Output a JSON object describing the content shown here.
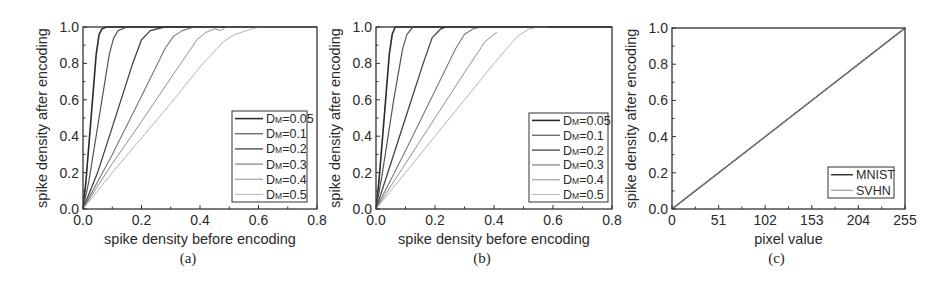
{
  "figure": {
    "panels": [
      "a",
      "b",
      "c"
    ]
  },
  "chart_data": [
    {
      "id": "a",
      "type": "line",
      "caption": "(a)",
      "xlabel": "spike density before encoding",
      "ylabel": "spike density after encoding",
      "xlim": [
        0,
        0.8
      ],
      "ylim": [
        0,
        1.0
      ],
      "xticks": [
        "0.0",
        "0.2",
        "0.4",
        "0.6",
        "0.8"
      ],
      "yticks": [
        "0.0",
        "0.2",
        "0.4",
        "0.6",
        "0.8",
        "1.0"
      ],
      "grid": false,
      "legend_position": "lower right",
      "frame": {
        "left": 83,
        "top": 27,
        "right": 317,
        "bottom": 209
      },
      "legend_box": {
        "x": 232,
        "y": 111,
        "w": 75,
        "h": 91
      },
      "series": [
        {
          "name": "DM=0.05",
          "label_main": "D",
          "label_sub": "M",
          "label_value": "=0.05",
          "color": "#2b2b2b",
          "width": 1.6,
          "x": [
            0,
            0.01,
            0.03,
            0.045,
            0.055,
            0.065,
            0.08,
            0.8
          ],
          "y": [
            0,
            0.15,
            0.55,
            0.85,
            0.96,
            0.99,
            1.0,
            1.0
          ]
        },
        {
          "name": "DM=0.1",
          "label_main": "D",
          "label_sub": "M",
          "label_value": "=0.1",
          "color": "#555555",
          "width": 1.2,
          "x": [
            0,
            0.02,
            0.06,
            0.09,
            0.105,
            0.12,
            0.15,
            0.8
          ],
          "y": [
            0,
            0.15,
            0.55,
            0.85,
            0.94,
            0.98,
            1.0,
            1.0
          ]
        },
        {
          "name": "DM=0.2",
          "label_main": "D",
          "label_sub": "M",
          "label_value": "=0.2",
          "color": "#444444",
          "width": 1.3,
          "x": [
            0,
            0.05,
            0.1,
            0.17,
            0.2,
            0.23,
            0.28,
            0.8
          ],
          "y": [
            0,
            0.2,
            0.45,
            0.8,
            0.93,
            0.98,
            1.0,
            1.0
          ]
        },
        {
          "name": "DM=0.3",
          "label_main": "D",
          "label_sub": "M",
          "label_value": "=0.3",
          "color": "#777777",
          "width": 1.1,
          "x": [
            0,
            0.1,
            0.2,
            0.28,
            0.31,
            0.34,
            0.38,
            0.8
          ],
          "y": [
            0,
            0.3,
            0.62,
            0.88,
            0.95,
            0.98,
            1.0,
            1.0
          ]
        },
        {
          "name": "DM=0.4",
          "label_main": "D",
          "label_sub": "M",
          "label_value": "=0.4",
          "color": "#909090",
          "width": 1.0,
          "x": [
            0,
            0.1,
            0.2,
            0.3,
            0.39,
            0.42,
            0.45,
            0.47,
            0.49,
            0.8
          ],
          "y": [
            0,
            0.25,
            0.48,
            0.72,
            0.93,
            0.97,
            0.99,
            0.98,
            1.0,
            1.0
          ]
        },
        {
          "name": "DM=0.5",
          "label_main": "D",
          "label_sub": "M",
          "label_value": "=0.5",
          "color": "#b5b5b5",
          "width": 1.0,
          "x": [
            0,
            0.1,
            0.2,
            0.3,
            0.4,
            0.48,
            0.52,
            0.56,
            0.6,
            0.8
          ],
          "y": [
            0,
            0.2,
            0.39,
            0.58,
            0.78,
            0.92,
            0.96,
            0.98,
            1.0,
            1.0
          ]
        }
      ]
    },
    {
      "id": "b",
      "type": "line",
      "caption": "(b)",
      "xlabel": "spike density before encoding",
      "ylabel": "spike density after encoding",
      "xlim": [
        0,
        0.8
      ],
      "ylim": [
        0,
        1.0
      ],
      "xticks": [
        "0.0",
        "0.2",
        "0.4",
        "0.6",
        "0.8"
      ],
      "yticks": [
        "0.0",
        "0.2",
        "0.4",
        "0.6",
        "0.8",
        "1.0"
      ],
      "grid": false,
      "legend_position": "lower right",
      "frame": {
        "left": 376,
        "top": 27,
        "right": 612,
        "bottom": 209
      },
      "legend_box": {
        "x": 529,
        "y": 113,
        "w": 79,
        "h": 89
      },
      "series": [
        {
          "name": "DM=0.05",
          "label_main": "D",
          "label_sub": "M",
          "label_value": "=0.05",
          "color": "#2b2b2b",
          "width": 1.6,
          "x": [
            0,
            0.01,
            0.03,
            0.045,
            0.055,
            0.065,
            0.8
          ],
          "y": [
            0,
            0.15,
            0.55,
            0.85,
            0.96,
            1.0,
            1.0
          ]
        },
        {
          "name": "DM=0.1",
          "label_main": "D",
          "label_sub": "M",
          "label_value": "=0.1",
          "color": "#555555",
          "width": 1.2,
          "x": [
            0,
            0.02,
            0.06,
            0.09,
            0.105,
            0.125,
            0.8
          ],
          "y": [
            0,
            0.18,
            0.6,
            0.88,
            0.96,
            1.0,
            1.0
          ]
        },
        {
          "name": "DM=0.2",
          "label_main": "D",
          "label_sub": "M",
          "label_value": "=0.2",
          "color": "#444444",
          "width": 1.3,
          "x": [
            0,
            0.05,
            0.1,
            0.16,
            0.19,
            0.22,
            0.24
          ],
          "y": [
            0,
            0.25,
            0.5,
            0.8,
            0.94,
            0.99,
            1.0
          ]
        },
        {
          "name": "DM=0.3",
          "label_main": "D",
          "label_sub": "M",
          "label_value": "=0.3",
          "color": "#777777",
          "width": 1.1,
          "x": [
            0,
            0.1,
            0.2,
            0.27,
            0.3,
            0.33,
            0.36
          ],
          "y": [
            0,
            0.32,
            0.65,
            0.88,
            0.96,
            0.99,
            1.0
          ]
        },
        {
          "name": "DM=0.4",
          "label_main": "D",
          "label_sub": "M",
          "label_value": "=0.4",
          "color": "#909090",
          "width": 1.0,
          "x": [
            0,
            0.1,
            0.2,
            0.3,
            0.37,
            0.4,
            0.41
          ],
          "y": [
            0,
            0.25,
            0.5,
            0.75,
            0.92,
            0.96,
            0.97
          ]
        },
        {
          "name": "DM=0.5",
          "label_main": "D",
          "label_sub": "M",
          "label_value": "=0.5",
          "color": "#b5b5b5",
          "width": 1.0,
          "x": [
            0,
            0.1,
            0.2,
            0.3,
            0.4,
            0.48,
            0.52,
            0.55,
            0.58
          ],
          "y": [
            0,
            0.2,
            0.4,
            0.6,
            0.8,
            0.95,
            0.99,
            1.0,
            1.0
          ]
        }
      ]
    },
    {
      "id": "c",
      "type": "line",
      "caption": "(c)",
      "xlabel": "pixel value",
      "ylabel": "spike density after encoding",
      "xlim": [
        0,
        255
      ],
      "ylim": [
        0,
        1.0
      ],
      "xticks": [
        "0",
        "51",
        "102",
        "153",
        "204",
        "255"
      ],
      "yticks": [
        "0.0",
        "0.2",
        "0.4",
        "0.6",
        "0.8",
        "1.0"
      ],
      "grid": false,
      "legend_position": "lower right",
      "frame": {
        "left": 672,
        "top": 28,
        "right": 905,
        "bottom": 209
      },
      "legend_box": {
        "x": 828,
        "y": 167,
        "w": 66,
        "h": 31
      },
      "series": [
        {
          "name": "MNIST",
          "label_main": "MNIST",
          "label_sub": "",
          "label_value": "",
          "color": "#2b2b2b",
          "width": 1.4,
          "x": [
            0,
            255
          ],
          "y": [
            0,
            1.0
          ]
        },
        {
          "name": "SVHN",
          "label_main": "SVHN",
          "label_sub": "",
          "label_value": "",
          "color": "#8a8a8a",
          "width": 1.0,
          "x": [
            0,
            255
          ],
          "y": [
            0,
            1.0
          ]
        }
      ]
    }
  ]
}
